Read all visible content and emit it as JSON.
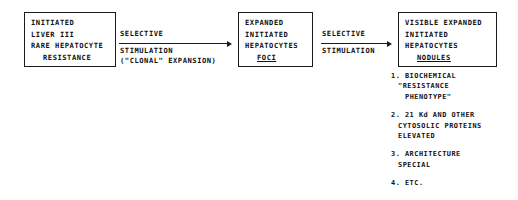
{
  "diagram": {
    "type": "flow",
    "nodes": [
      {
        "id": "initiated",
        "name": "initiated-liver-box",
        "lines": [
          {
            "text": "INITIATED",
            "indent": false,
            "underline": false
          },
          {
            "text": "LIVER III",
            "indent": false,
            "underline": false
          },
          {
            "text": "RARE HEPATOCYTE",
            "indent": false,
            "underline": false
          },
          {
            "text": "RESISTANCE",
            "indent": true,
            "underline": false
          }
        ]
      },
      {
        "id": "foci",
        "name": "expanded-foci-box",
        "lines": [
          {
            "text": "EXPANDED",
            "indent": false,
            "underline": false
          },
          {
            "text": "INITIATED",
            "indent": false,
            "underline": false
          },
          {
            "text": "HEPATOCYTES",
            "indent": false,
            "underline": false
          },
          {
            "text": "FOCI",
            "indent": true,
            "underline": true
          }
        ]
      },
      {
        "id": "nodules",
        "name": "visible-nodules-box",
        "lines": [
          {
            "text": "VISIBLE EXPANDED",
            "indent": false,
            "underline": false
          },
          {
            "text": "INITIATED",
            "indent": false,
            "underline": false
          },
          {
            "text": "HEPATOCYTES",
            "indent": false,
            "underline": false
          },
          {
            "text": "NODULES",
            "indent": true,
            "underline": true
          }
        ]
      }
    ],
    "edges": [
      {
        "id": "edge1",
        "name": "arrow-initiated-to-foci",
        "from": "initiated",
        "to": "foci",
        "label_above": "SELECTIVE",
        "label_below_1": "STIMULATION",
        "label_below_2": "(\"CLONAL\" EXPANSION)"
      },
      {
        "id": "edge2",
        "name": "arrow-foci-to-nodules",
        "from": "foci",
        "to": "nodules",
        "label_above": "SELECTIVE",
        "label_below_1": "STIMULATION",
        "label_below_2": ""
      }
    ],
    "annotations": {
      "name": "nodule-properties-list",
      "items": [
        {
          "marker": "1.",
          "lines": [
            "1. BIOCHEMICAL",
            "\"RESISTANCE",
            "PHENOTYPE\""
          ]
        },
        {
          "marker": "2.",
          "lines": [
            "2. 21 Kd AND OTHER",
            "CYTOSOLIC PROTEINS",
            "ELEVATED"
          ]
        },
        {
          "marker": "3.",
          "lines": [
            "3. ARCHITECTURE",
            "SPECIAL"
          ]
        },
        {
          "marker": "4.",
          "lines": [
            "4. ETC."
          ]
        }
      ]
    },
    "colors": {
      "background": "#ffffff",
      "ink": "#1a1a1a"
    }
  }
}
